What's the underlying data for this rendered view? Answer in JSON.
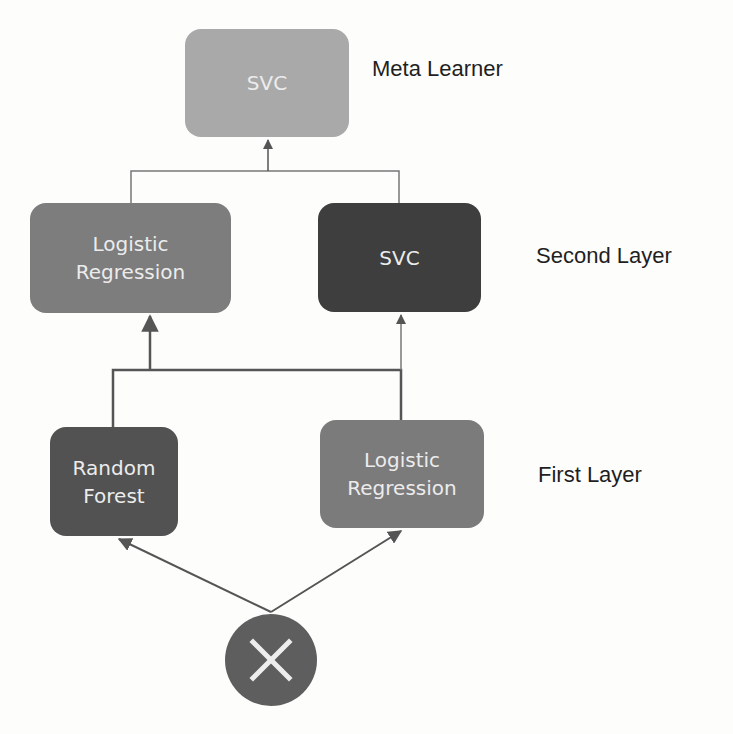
{
  "diagram": {
    "type": "stacking-ensemble",
    "colors": {
      "background": "#fdfdfc",
      "wire": "#555555",
      "meta_svc": "#a9a9a9",
      "l2_logistic": "#7d7d7d",
      "l2_svc": "#3e3e3e",
      "l1_random_forest": "#525252",
      "l1_logistic": "#7b7b7b",
      "input_node": "#5e5e5e",
      "node_text": "#ececec",
      "label_text": "#1f1f1f"
    },
    "layers": [
      {
        "id": "meta",
        "label": "Meta Learner",
        "nodes": [
          {
            "id": "meta-svc",
            "text": "SVC"
          }
        ]
      },
      {
        "id": "second",
        "label": "Second Layer",
        "nodes": [
          {
            "id": "l2-logistic",
            "text": "Logistic\nRegression"
          },
          {
            "id": "l2-svc",
            "text": "SVC"
          }
        ]
      },
      {
        "id": "first",
        "label": "First Layer",
        "nodes": [
          {
            "id": "l1-random-forest",
            "text": "Random\nForest"
          },
          {
            "id": "l1-logistic",
            "text": "Logistic\nRegression"
          }
        ]
      }
    ],
    "input": {
      "id": "input-x",
      "icon": "x-cross-icon"
    },
    "edges": [
      {
        "from": "input-x",
        "to": "l1-random-forest"
      },
      {
        "from": "input-x",
        "to": "l1-logistic"
      },
      {
        "from": "l1-random-forest",
        "to": "l2-logistic"
      },
      {
        "from": "l1-random-forest",
        "to": "l2-svc"
      },
      {
        "from": "l1-logistic",
        "to": "l2-logistic"
      },
      {
        "from": "l1-logistic",
        "to": "l2-svc"
      },
      {
        "from": "l2-logistic",
        "to": "meta-svc"
      },
      {
        "from": "l2-svc",
        "to": "meta-svc"
      }
    ]
  }
}
